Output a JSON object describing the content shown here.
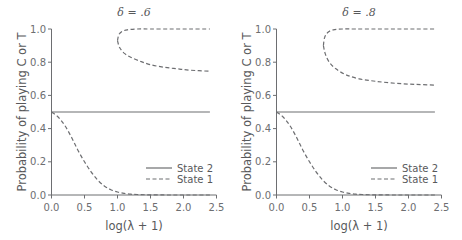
{
  "chart_data": [
    {
      "type": "line",
      "title": "δ = .6",
      "xlabel": "log(λ + 1)",
      "ylabel": "Probability of playing C or T",
      "xlim": [
        0,
        2.5
      ],
      "ylim": [
        0,
        1.0
      ],
      "xticks": [
        "0.0",
        "0.5",
        "1.0",
        "1.5",
        "2.0",
        "2.5"
      ],
      "yticks": [
        "0.0",
        "0.2",
        "0.4",
        "0.6",
        "0.8",
        "1.0"
      ],
      "grid": false,
      "legend_position": "lower right",
      "series": [
        {
          "name": "State 2",
          "style": "solid",
          "x": [
            0.0,
            2.4
          ],
          "y": [
            0.5,
            0.5
          ]
        },
        {
          "name": "State 1",
          "style": "dashed",
          "branch": "low",
          "x": [
            0.0,
            0.1,
            0.2,
            0.3,
            0.4,
            0.5,
            0.6,
            0.7,
            0.8,
            0.9,
            1.0,
            1.1,
            1.2,
            1.3,
            1.5,
            1.8,
            2.1,
            2.4
          ],
          "y": [
            0.5,
            0.47,
            0.42,
            0.35,
            0.27,
            0.2,
            0.14,
            0.09,
            0.055,
            0.032,
            0.018,
            0.01,
            0.005,
            0.003,
            0.001,
            0.0,
            0.0,
            0.0
          ]
        },
        {
          "name": "State 1",
          "style": "dashed",
          "branch": "high-upper",
          "x": [
            1.0,
            1.02,
            1.07,
            1.15,
            1.3,
            1.5,
            1.8,
            2.1,
            2.4
          ],
          "y": [
            0.93,
            0.965,
            0.985,
            0.995,
            1.0,
            1.0,
            1.0,
            1.0,
            1.0
          ]
        },
        {
          "name": "State 1",
          "style": "dashed",
          "branch": "high-lower",
          "x": [
            1.0,
            1.03,
            1.1,
            1.2,
            1.35,
            1.5,
            1.7,
            1.9,
            2.1,
            2.4
          ],
          "y": [
            0.93,
            0.89,
            0.855,
            0.83,
            0.805,
            0.785,
            0.77,
            0.76,
            0.752,
            0.745
          ]
        }
      ]
    },
    {
      "type": "line",
      "title": "δ = .8",
      "xlabel": "log(λ + 1)",
      "ylabel": "Probability of playing C or T",
      "xlim": [
        0,
        2.5
      ],
      "ylim": [
        0,
        1.0
      ],
      "xticks": [
        "0.0",
        "0.5",
        "1.0",
        "1.5",
        "2.0",
        "2.5"
      ],
      "yticks": [
        "0.0",
        "0.2",
        "0.4",
        "0.6",
        "0.8",
        "1.0"
      ],
      "grid": false,
      "legend_position": "lower right",
      "series": [
        {
          "name": "State 2",
          "style": "solid",
          "x": [
            0.0,
            2.4
          ],
          "y": [
            0.5,
            0.5
          ]
        },
        {
          "name": "State 1",
          "style": "dashed",
          "branch": "low",
          "x": [
            0.0,
            0.1,
            0.2,
            0.3,
            0.4,
            0.5,
            0.6,
            0.7,
            0.8,
            0.9,
            1.0,
            1.1,
            1.2,
            1.3,
            1.5,
            1.8,
            2.1,
            2.4
          ],
          "y": [
            0.5,
            0.47,
            0.42,
            0.35,
            0.27,
            0.2,
            0.14,
            0.09,
            0.055,
            0.032,
            0.018,
            0.01,
            0.005,
            0.003,
            0.001,
            0.0,
            0.0,
            0.0
          ]
        },
        {
          "name": "State 1",
          "style": "dashed",
          "branch": "high-upper",
          "x": [
            0.71,
            0.73,
            0.78,
            0.86,
            1.0,
            1.2,
            1.5,
            1.8,
            2.1,
            2.4
          ],
          "y": [
            0.9,
            0.95,
            0.98,
            0.995,
            1.0,
            1.0,
            1.0,
            1.0,
            1.0,
            1.0
          ]
        },
        {
          "name": "State 1",
          "style": "dashed",
          "branch": "high-lower",
          "x": [
            0.71,
            0.74,
            0.8,
            0.9,
            1.05,
            1.25,
            1.5,
            1.8,
            2.1,
            2.4
          ],
          "y": [
            0.9,
            0.85,
            0.8,
            0.76,
            0.725,
            0.7,
            0.685,
            0.673,
            0.666,
            0.662
          ]
        }
      ]
    }
  ],
  "panels": [
    {
      "title": "δ = .6",
      "xlabel": "log(λ + 1)",
      "ylabel": "Probability of playing C or T",
      "legend": [
        {
          "label": "State 2"
        },
        {
          "label": "State 1"
        }
      ],
      "xticks": [
        "0.0",
        "0.5",
        "1.0",
        "1.5",
        "2.0",
        "2.5"
      ],
      "yticks": [
        "0.0",
        "0.2",
        "0.4",
        "0.6",
        "0.8",
        "1.0"
      ]
    },
    {
      "title": "δ = .8",
      "xlabel": "log(λ + 1)",
      "ylabel": "Probability of playing C or T",
      "legend": [
        {
          "label": "State 2"
        },
        {
          "label": "State 1"
        }
      ],
      "xticks": [
        "0.0",
        "0.5",
        "1.0",
        "1.5",
        "2.0",
        "2.5"
      ],
      "yticks": [
        "0.0",
        "0.2",
        "0.4",
        "0.6",
        "0.8",
        "1.0"
      ]
    }
  ]
}
